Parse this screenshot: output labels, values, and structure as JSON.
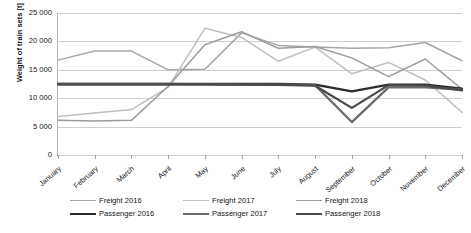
{
  "chart_data": {
    "type": "line",
    "title": "",
    "xlabel": "",
    "ylabel": "Weight of train sets [t]",
    "ylim": [
      0,
      25000
    ],
    "ytick_step": 5000,
    "ytick_labels": [
      "25 000",
      "20 000",
      "15 000",
      "10 000",
      "5 000",
      "0"
    ],
    "ytick_values": [
      25000,
      20000,
      15000,
      10000,
      5000,
      0
    ],
    "grid": true,
    "legend_position": "bottom",
    "categories": [
      "January",
      "February",
      "March",
      "April",
      "May",
      "June",
      "July",
      "August",
      "September",
      "October",
      "November",
      "December"
    ],
    "series": [
      {
        "name": "Freight 2016",
        "color": "#a6a6a6",
        "values": [
          16700,
          18300,
          18300,
          15000,
          15100,
          21500,
          19300,
          19000,
          18800,
          18900,
          19800,
          16600
        ]
      },
      {
        "name": "Freight 2017",
        "color": "#bfbfbf",
        "values": [
          6800,
          7400,
          8000,
          11900,
          22300,
          20700,
          16500,
          19000,
          14300,
          16300,
          13200,
          7500
        ]
      },
      {
        "name": "Freight 2018",
        "color": "#9c9c9c",
        "values": [
          6100,
          6000,
          6100,
          12100,
          19400,
          21700,
          18800,
          19100,
          17100,
          13800,
          16900,
          11600
        ]
      },
      {
        "name": "Passenger 2016",
        "color": "#2b2b2b",
        "values": [
          12500,
          12500,
          12500,
          12500,
          12500,
          12500,
          12500,
          12400,
          11200,
          12400,
          12400,
          11700
        ]
      },
      {
        "name": "Passenger 2017",
        "color": "#6b6b6b",
        "values": [
          12500,
          12500,
          12500,
          12500,
          12450,
          12400,
          12400,
          12300,
          5800,
          11900,
          11900,
          11500
        ]
      },
      {
        "name": "Passenger 2018",
        "color": "#4a4a4a",
        "values": [
          12450,
          12450,
          12450,
          12450,
          12450,
          12400,
          12350,
          12200,
          8300,
          12300,
          12200,
          11400
        ]
      }
    ]
  },
  "legend": {
    "entries": [
      {
        "label": "Freight 2016",
        "color": "#a6a6a6",
        "weight": 1.7
      },
      {
        "label": "Freight 2017",
        "color": "#bfbfbf",
        "weight": 1.7
      },
      {
        "label": "Freight 2018",
        "color": "#9c9c9c",
        "weight": 1.7
      },
      {
        "label": "Passenger 2016",
        "color": "#2b2b2b",
        "weight": 2.6
      },
      {
        "label": "Passenger 2017",
        "color": "#6b6b6b",
        "weight": 2.4
      },
      {
        "label": "Passenger 2018",
        "color": "#4a4a4a",
        "weight": 2.4
      }
    ]
  }
}
